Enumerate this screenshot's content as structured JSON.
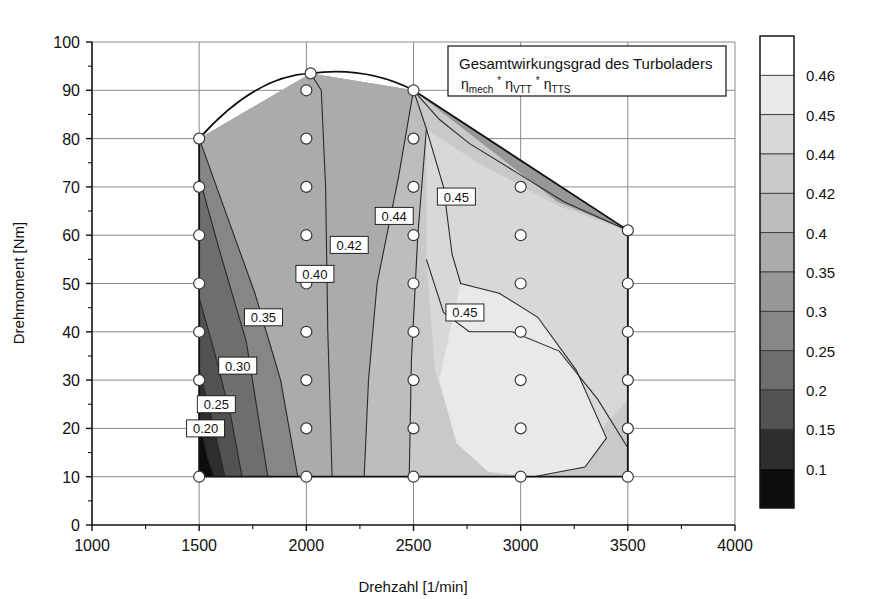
{
  "chart_data": {
    "type": "heatmap",
    "title": "Gesamtwirkungsgrad des Turboladers",
    "subtitle_parts": [
      "η",
      "mech",
      "*",
      "η",
      "VTT",
      "*",
      "η",
      "TTS"
    ],
    "xlabel": "Drehzahl [1/min]",
    "ylabel": "Drehmoment [Nm]",
    "xlim": [
      1000,
      4000
    ],
    "ylim": [
      0,
      100
    ],
    "xticks": [
      1000,
      1500,
      2000,
      2500,
      3000,
      3500,
      4000
    ],
    "yticks": [
      0,
      10,
      20,
      30,
      40,
      50,
      60,
      70,
      80,
      90,
      100
    ],
    "xtick_labels": [
      "1000",
      "1500",
      "2000",
      "2500",
      "3000",
      "3500",
      "4000"
    ],
    "ytick_labels": [
      "0",
      "10",
      "20",
      "30",
      "40",
      "50",
      "60",
      "70",
      "80",
      "90",
      "100"
    ],
    "grid": true,
    "legend_position": "colorbar-right",
    "colorbar_levels": [
      0.1,
      0.15,
      0.2,
      0.25,
      0.3,
      0.35,
      0.4,
      0.42,
      0.44,
      0.45,
      0.46
    ],
    "colorbar_labels": [
      "0.46",
      "0.45",
      "0.44",
      "0.42",
      "0.4",
      "0.35",
      "0.3",
      "0.25",
      "0.2",
      "0.15",
      "0.1"
    ],
    "colorbar_colors": [
      "#ffffff",
      "#e9e9e9",
      "#d8d8d8",
      "#c9c9c9",
      "#bdbdbd",
      "#ababab",
      "#979797",
      "#868686",
      "#6e6e6e",
      "#525252",
      "#2e2e2e",
      "#0d0d0d"
    ],
    "contour_labels": [
      {
        "text": "0.20",
        "x": 1530,
        "y": 20
      },
      {
        "text": "0.25",
        "x": 1580,
        "y": 25
      },
      {
        "text": "0.30",
        "x": 1680,
        "y": 33
      },
      {
        "text": "0.35",
        "x": 1800,
        "y": 43
      },
      {
        "text": "0.40",
        "x": 2040,
        "y": 52
      },
      {
        "text": "0.42",
        "x": 2200,
        "y": 58
      },
      {
        "text": "0.44",
        "x": 2410,
        "y": 64
      },
      {
        "text": "0.45",
        "x": 2700,
        "y": 68
      },
      {
        "text": "0.45",
        "x": 2740,
        "y": 44
      }
    ],
    "measurement_points": [
      {
        "x": 1500,
        "y": 10
      },
      {
        "x": 1500,
        "y": 20
      },
      {
        "x": 1500,
        "y": 30
      },
      {
        "x": 1500,
        "y": 40
      },
      {
        "x": 1500,
        "y": 50
      },
      {
        "x": 1500,
        "y": 60
      },
      {
        "x": 1500,
        "y": 70
      },
      {
        "x": 1500,
        "y": 80
      },
      {
        "x": 2000,
        "y": 10
      },
      {
        "x": 2000,
        "y": 20
      },
      {
        "x": 2000,
        "y": 30
      },
      {
        "x": 2000,
        "y": 40
      },
      {
        "x": 2000,
        "y": 50
      },
      {
        "x": 2000,
        "y": 60
      },
      {
        "x": 2000,
        "y": 70
      },
      {
        "x": 2000,
        "y": 80
      },
      {
        "x": 2000,
        "y": 90
      },
      {
        "x": 2020,
        "y": 93.5
      },
      {
        "x": 2500,
        "y": 10
      },
      {
        "x": 2500,
        "y": 20
      },
      {
        "x": 2500,
        "y": 30
      },
      {
        "x": 2500,
        "y": 40
      },
      {
        "x": 2500,
        "y": 50
      },
      {
        "x": 2500,
        "y": 60
      },
      {
        "x": 2500,
        "y": 70
      },
      {
        "x": 2500,
        "y": 80
      },
      {
        "x": 2500,
        "y": 90
      },
      {
        "x": 3000,
        "y": 10
      },
      {
        "x": 3000,
        "y": 20
      },
      {
        "x": 3000,
        "y": 30
      },
      {
        "x": 3000,
        "y": 40
      },
      {
        "x": 3000,
        "y": 50
      },
      {
        "x": 3000,
        "y": 60
      },
      {
        "x": 3000,
        "y": 70
      },
      {
        "x": 3500,
        "y": 10
      },
      {
        "x": 3500,
        "y": 20
      },
      {
        "x": 3500,
        "y": 30
      },
      {
        "x": 3500,
        "y": 40
      },
      {
        "x": 3500,
        "y": 50
      },
      {
        "x": 3500,
        "y": 61
      }
    ],
    "envelope": [
      {
        "x": 1500,
        "y": 10
      },
      {
        "x": 1500,
        "y": 80
      },
      {
        "x": 2020,
        "y": 93.5
      },
      {
        "x": 2500,
        "y": 90
      },
      {
        "x": 3500,
        "y": 61
      },
      {
        "x": 3500,
        "y": 10
      }
    ]
  },
  "legend_box": {
    "title": "Gesamtwirkungsgrad des Turboladers",
    "eta": "η",
    "sub1": "mech",
    "star1": "*",
    "sub2": "VTT",
    "star2": "*",
    "sub3": "TTS"
  }
}
